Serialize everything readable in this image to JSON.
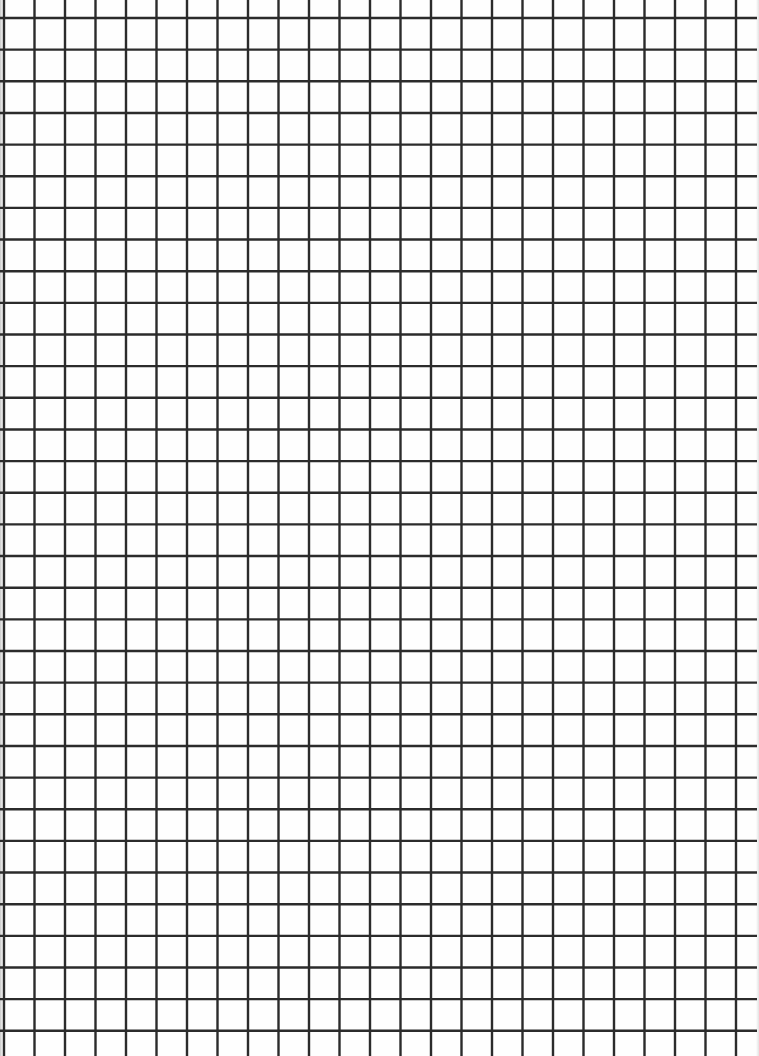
{
  "document": {
    "type": "grid-paper",
    "description": "Blank square-ruled graph paper",
    "grid": {
      "columns": 25,
      "rows": 32,
      "line_color": "#2b2b2b",
      "paper_color": "#fefefe"
    },
    "text": []
  }
}
